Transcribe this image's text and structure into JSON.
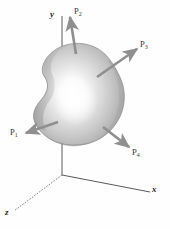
{
  "figure": {
    "type": "free-body-diagram",
    "background_color": "#fefefe",
    "body": {
      "name": "rigid-body-blob",
      "shape": "kidney",
      "fill_light": "#ffffff",
      "fill_mid": "#cfcfcf",
      "fill_dark": "#9a9a9a",
      "outline_color": "#8c8c8c"
    },
    "axes": [
      {
        "id": "y",
        "label": "y",
        "style": "solid",
        "color": "#555555"
      },
      {
        "id": "x",
        "label": "x",
        "style": "solid",
        "color": "#555555"
      },
      {
        "id": "z",
        "label": "z",
        "style": "dashed",
        "color": "#777777"
      }
    ],
    "forces": [
      {
        "id": "P1",
        "label": "P",
        "sub": "1",
        "direction": "left",
        "color": "#8f8f8f"
      },
      {
        "id": "P2",
        "label": "P",
        "sub": "2",
        "direction": "up",
        "color": "#8f8f8f"
      },
      {
        "id": "P3",
        "label": "P",
        "sub": "3",
        "direction": "upper-right",
        "color": "#8f8f8f"
      },
      {
        "id": "P4",
        "label": "P",
        "sub": "4",
        "direction": "lower-right",
        "color": "#8f8f8f"
      }
    ],
    "caption": ""
  }
}
